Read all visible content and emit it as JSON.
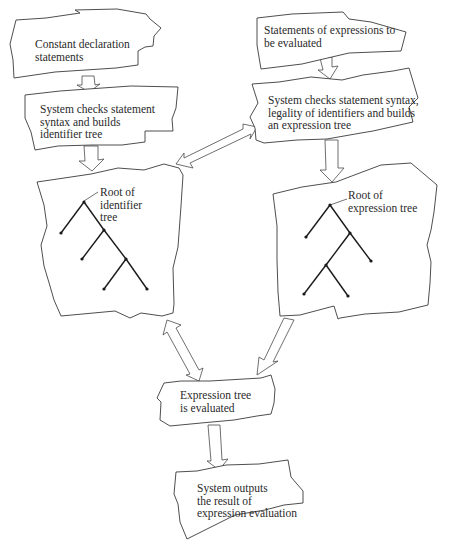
{
  "diagram": {
    "type": "flowchart",
    "style": "hand-drawn irregular boxes with hollow arrows",
    "boxes": {
      "constant_decl": {
        "label": "Constant declaration\nstatements"
      },
      "check_identifier": {
        "label": "System checks statement\nsyntax and builds\nidentifier tree"
      },
      "expr_statements": {
        "label": "Statements of expressions to\nbe evaluated"
      },
      "check_expression": {
        "label": "System checks statement syntax,\nlegality of identifiers and builds\nan expression tree"
      },
      "identifier_tree": {
        "label": "Root of\nidentifier\ntree"
      },
      "expression_tree": {
        "label": "Root of\nexpression tree"
      },
      "evaluate": {
        "label": "Expression tree\nis evaluated"
      },
      "output": {
        "label": "System outputs\nthe result of\nexpression evaluation"
      }
    },
    "arrows": [
      {
        "from": "constant_decl",
        "to": "check_identifier",
        "direction": "one-way"
      },
      {
        "from": "check_identifier",
        "to": "identifier_tree",
        "direction": "one-way"
      },
      {
        "from": "expr_statements",
        "to": "check_expression",
        "direction": "one-way"
      },
      {
        "from": "check_expression",
        "to": "expression_tree",
        "direction": "one-way"
      },
      {
        "from": "identifier_tree",
        "to": "check_expression",
        "direction": "two-way"
      },
      {
        "from": "identifier_tree",
        "to": "evaluate",
        "direction": "two-way"
      },
      {
        "from": "expression_tree",
        "to": "evaluate",
        "direction": "one-way"
      },
      {
        "from": "evaluate",
        "to": "output",
        "direction": "one-way"
      }
    ],
    "colors": {
      "line": "#3a3a3a",
      "tree": "#1a1a1a",
      "background": "#ffffff",
      "text": "#2a2a2a"
    }
  }
}
